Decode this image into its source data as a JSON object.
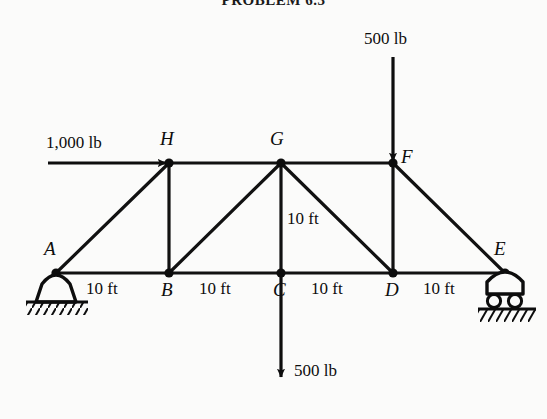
{
  "figure": {
    "title": "PROBLEM 6.3",
    "type": "truss-free-body-diagram"
  },
  "joints": [
    {
      "name": "A",
      "label": "A",
      "x": 56,
      "y": 273,
      "label_x": 44,
      "label_y": 238,
      "support": "pin"
    },
    {
      "name": "B",
      "label": "B",
      "x": 169,
      "y": 273,
      "label_x": 161,
      "label_y": 279,
      "support": "none"
    },
    {
      "name": "C",
      "label": "C",
      "x": 281,
      "y": 273,
      "label_x": 273,
      "label_y": 279,
      "support": "none"
    },
    {
      "name": "D",
      "label": "D",
      "x": 393,
      "y": 273,
      "label_x": 385,
      "label_y": 279,
      "support": "none"
    },
    {
      "name": "E",
      "label": "E",
      "x": 505,
      "y": 273,
      "label_x": 494,
      "label_y": 238,
      "support": "roller"
    },
    {
      "name": "F",
      "label": "F",
      "x": 393,
      "y": 163,
      "label_x": 401,
      "label_y": 146,
      "support": "none"
    },
    {
      "name": "G",
      "label": "G",
      "x": 281,
      "y": 163,
      "label_x": 270,
      "label_y": 128,
      "support": "none"
    },
    {
      "name": "H",
      "label": "H",
      "x": 169,
      "y": 163,
      "label_x": 160,
      "label_y": 128,
      "support": "none"
    }
  ],
  "members": [
    {
      "name": "A-B",
      "from": "A",
      "to": "B",
      "kind": "bottom-chord"
    },
    {
      "name": "B-C",
      "from": "B",
      "to": "C",
      "kind": "bottom-chord"
    },
    {
      "name": "C-D",
      "from": "C",
      "to": "D",
      "kind": "bottom-chord"
    },
    {
      "name": "D-E",
      "from": "D",
      "to": "E",
      "kind": "bottom-chord"
    },
    {
      "name": "H-G",
      "from": "H",
      "to": "G",
      "kind": "top-chord"
    },
    {
      "name": "G-F",
      "from": "G",
      "to": "F",
      "kind": "top-chord"
    },
    {
      "name": "A-H",
      "from": "A",
      "to": "H",
      "kind": "diagonal"
    },
    {
      "name": "B-G",
      "from": "B",
      "to": "G",
      "kind": "diagonal"
    },
    {
      "name": "G-D",
      "from": "G",
      "to": "D",
      "kind": "diagonal"
    },
    {
      "name": "F-E",
      "from": "F",
      "to": "E",
      "kind": "diagonal"
    },
    {
      "name": "H-B",
      "from": "H",
      "to": "B",
      "kind": "vertical"
    },
    {
      "name": "G-C",
      "from": "G",
      "to": "C",
      "kind": "vertical"
    },
    {
      "name": "F-D",
      "from": "F",
      "to": "D",
      "kind": "vertical"
    }
  ],
  "loads": [
    {
      "name": "load-1000-lb-at-H",
      "label": "1,000 lb",
      "magnitude": "1,000",
      "unit": "lb",
      "direction": "right",
      "applied_at": "H",
      "label_x": 46,
      "label_y": 133,
      "tail_x": 48,
      "tail_y": 163,
      "head_x": 169,
      "head_y": 163
    },
    {
      "name": "load-500-lb-at-F",
      "label": "500 lb",
      "magnitude": "500",
      "unit": "lb",
      "direction": "down",
      "applied_at": "F",
      "label_x": 364,
      "label_y": 29,
      "tail_x": 393,
      "tail_y": 57,
      "head_x": 393,
      "head_y": 163
    },
    {
      "name": "load-500-lb-at-C",
      "label": "500 lb",
      "magnitude": "500",
      "unit": "lb",
      "direction": "down",
      "applied_at": "C",
      "label_x": 294,
      "label_y": 361,
      "tail_x": 281,
      "tail_y": 273,
      "head_x": 281,
      "head_y": 379
    }
  ],
  "dimensions": [
    {
      "name": "dim-A-B",
      "label": "10 ft",
      "x": 86,
      "y": 279,
      "orientation": "horizontal",
      "span": "A-B"
    },
    {
      "name": "dim-B-C",
      "label": "10 ft",
      "x": 199,
      "y": 279,
      "orientation": "horizontal",
      "span": "B-C"
    },
    {
      "name": "dim-C-D",
      "label": "10 ft",
      "x": 311,
      "y": 279,
      "orientation": "horizontal",
      "span": "C-D"
    },
    {
      "name": "dim-D-E",
      "label": "10 ft",
      "x": 423,
      "y": 279,
      "orientation": "horizontal",
      "span": "D-E"
    },
    {
      "name": "dim-G-C",
      "label": "10 ft",
      "x": 287,
      "y": 209,
      "orientation": "vertical",
      "span": "G-C"
    }
  ],
  "supports": [
    {
      "name": "pin-support-A",
      "at": "A",
      "type": "pin",
      "x": 56,
      "y": 273
    },
    {
      "name": "roller-support-E",
      "at": "E",
      "type": "roller",
      "x": 505,
      "y": 273
    }
  ],
  "colors": {
    "ink": "#0d0d0d",
    "paper": "#fbfbfa",
    "member": "#111111"
  }
}
